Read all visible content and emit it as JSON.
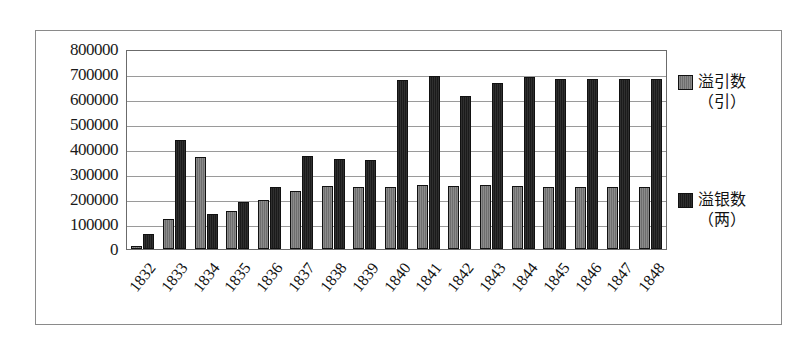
{
  "chart_data": {
    "type": "bar",
    "title": "",
    "subtitle": "",
    "xlabel": "",
    "ylabel": "",
    "ylim": [
      0,
      800000
    ],
    "ytick_step": 100000,
    "yticks": [
      "800000",
      "700000",
      "600000",
      "500000",
      "400000",
      "300000",
      "200000",
      "100000",
      "0"
    ],
    "grid": true,
    "legend_position": "right",
    "categories": [
      "1832",
      "1833",
      "1834",
      "1835",
      "1836",
      "1837",
      "1838",
      "1839",
      "1840",
      "1841",
      "1842",
      "1843",
      "1844",
      "1845",
      "1846",
      "1847",
      "1848"
    ],
    "series": [
      {
        "name": "溢引数（引）",
        "label_line1": "溢引数",
        "label_line2": "（引）",
        "color": "#7a7a7a",
        "values": [
          12000,
          120000,
          370000,
          155000,
          200000,
          235000,
          255000,
          250000,
          250000,
          258000,
          255000,
          258000,
          255000,
          252000,
          252000,
          250000,
          252000
        ]
      },
      {
        "name": "溢银数（两）",
        "label_line1": "溢银数",
        "label_line2": "（两）",
        "color": "#222222",
        "values": [
          62000,
          440000,
          140000,
          190000,
          250000,
          375000,
          365000,
          360000,
          682000,
          698000,
          620000,
          670000,
          695000,
          685000,
          685000,
          685000,
          685000
        ]
      }
    ]
  }
}
